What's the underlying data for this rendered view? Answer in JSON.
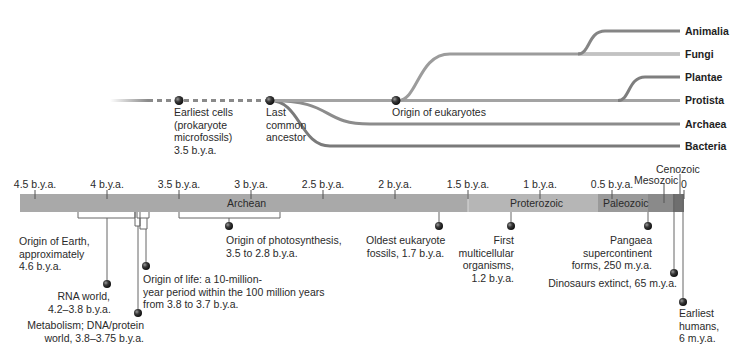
{
  "tree": {
    "nodes": [
      {
        "id": "earliest-cells",
        "label_lines": [
          "Earliest cells",
          "(prokaryote",
          "microfossils)",
          "3.5 b.y.a."
        ]
      },
      {
        "id": "last-common-ancestor",
        "label_lines": [
          "Last",
          "common",
          "ancestor"
        ]
      },
      {
        "id": "origin-eukaryotes",
        "label_lines": [
          "Origin of eukaryotes"
        ]
      }
    ],
    "taxa": [
      "Animalia",
      "Fungi",
      "Plantae",
      "Protista",
      "Archaea",
      "Bacteria"
    ]
  },
  "timeline": {
    "ticks": [
      "4.5 b.y.a.",
      "4 b.y.a.",
      "3.5 b.y.a.",
      "3 b.y.a.",
      "2.5 b.y.a.",
      "2 b.y.a.",
      "1.5 b.y.a.",
      "1 b.y.a.",
      "0.5 b.y.a.",
      "0"
    ],
    "eras": [
      {
        "name": "Archean",
        "color": "#a9a9a9"
      },
      {
        "name": "Proterozoic",
        "color": "#b6b6b6"
      },
      {
        "name": "Paleozoic",
        "color": "#9a9a9a"
      },
      {
        "name": "Mesozoic",
        "color": "#8a8a8a"
      },
      {
        "name": "Cenozoic",
        "color": "#6f6f6f"
      }
    ]
  },
  "events": [
    {
      "id": "origin-earth",
      "lines": [
        "Origin of Earth,",
        "approximately",
        "4.6 b.y.a."
      ]
    },
    {
      "id": "rna-world",
      "lines": [
        "RNA world,",
        "4.2–3.8 b.y.a."
      ]
    },
    {
      "id": "metabolism",
      "lines": [
        "Metabolism; DNA/protein",
        "world, 3.8–3.75 b.y.a."
      ]
    },
    {
      "id": "origin-life",
      "lines": [
        "Origin of life: a 10-million-",
        "year period within the 100 million years",
        "from 3.8 to 3.7 b.y.a."
      ]
    },
    {
      "id": "photosynthesis",
      "lines": [
        "Origin of photosynthesis,",
        "3.5 to 2.8 b.y.a."
      ]
    },
    {
      "id": "oldest-eukaryote",
      "lines": [
        "Oldest eukaryote",
        "fossils, 1.7 b.y.a."
      ]
    },
    {
      "id": "multicellular",
      "lines": [
        "First",
        "multicellular",
        "organisms,",
        "1.2 b.y.a."
      ]
    },
    {
      "id": "pangaea",
      "lines": [
        "Pangaea",
        "supercontinent",
        "forms, 250 m.y.a."
      ]
    },
    {
      "id": "dinosaurs",
      "lines": [
        "Dinosaurs extinct, 65 m.y.a."
      ]
    },
    {
      "id": "humans",
      "lines": [
        "Earliest",
        "humans,",
        "6 m.y.a."
      ]
    }
  ]
}
